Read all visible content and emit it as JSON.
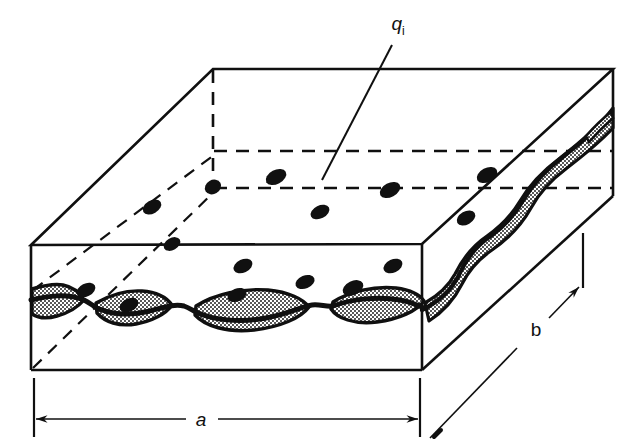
{
  "figure": {
    "kind": "technical-line-drawing",
    "background_color": "#ffffff",
    "line_color": "#101010",
    "particle_color": "#101010",
    "stipple_fill_color": "#101010",
    "stipple_background_color": "#ffffff"
  },
  "labels": {
    "particle": {
      "symbol": "q",
      "subscript": "i",
      "full": "qi",
      "x": 398,
      "y": 30
    },
    "dimension_a": {
      "text": "a",
      "x": 201,
      "y": 419
    },
    "dimension_b": {
      "text": "b",
      "x": 536,
      "y": 329
    }
  },
  "geometry": {
    "front_top_left": [
      31,
      245
    ],
    "front_top_right": [
      422,
      244
    ],
    "front_bottom_left": [
      31,
      370
    ],
    "front_bottom_right": [
      422,
      370
    ],
    "back_top_left": [
      213,
      69
    ],
    "back_top_right": [
      613,
      69
    ],
    "right_far_top": [
      613,
      69
    ],
    "right_far_bottom": [
      613,
      196
    ],
    "hidden_corner": [
      213,
      196
    ]
  },
  "particles": [
    {
      "cx": 276,
      "cy": 177,
      "rx": 11,
      "ry": 7,
      "rot": -28
    },
    {
      "cx": 390,
      "cy": 190,
      "rx": 11,
      "ry": 7,
      "rot": -28
    },
    {
      "cx": 320,
      "cy": 212,
      "rx": 10,
      "ry": 6.5,
      "rot": -26
    },
    {
      "cx": 466,
      "cy": 218,
      "rx": 10,
      "ry": 6.5,
      "rot": -30
    },
    {
      "cx": 487,
      "cy": 175,
      "rx": 11,
      "ry": 7,
      "rot": -28
    },
    {
      "cx": 213,
      "cy": 187,
      "rx": 8,
      "ry": 7,
      "rot": -30
    },
    {
      "cx": 152,
      "cy": 207,
      "rx": 10,
      "ry": 6.5,
      "rot": -30
    },
    {
      "cx": 172,
      "cy": 244,
      "rx": 9,
      "ry": 6,
      "rot": -30
    },
    {
      "cx": 243,
      "cy": 266,
      "rx": 10,
      "ry": 6.5,
      "rot": -25
    },
    {
      "cx": 305,
      "cy": 282,
      "rx": 10,
      "ry": 6.5,
      "rot": -22
    },
    {
      "cx": 393,
      "cy": 266,
      "rx": 10,
      "ry": 6.5,
      "rot": -25
    },
    {
      "cx": 86,
      "cy": 290,
      "rx": 10,
      "ry": 6.5,
      "rot": -27
    },
    {
      "cx": 129,
      "cy": 305,
      "rx": 10,
      "ry": 6.5,
      "rot": -27
    },
    {
      "cx": 237,
      "cy": 295,
      "rx": 10,
      "ry": 6.5,
      "rot": -22
    },
    {
      "cx": 353,
      "cy": 288,
      "rx": 11,
      "ry": 7,
      "rot": -26
    }
  ],
  "leader_line": {
    "from": [
      392,
      45
    ],
    "to": [
      322,
      180
    ]
  },
  "dimension_lines": {
    "a": {
      "y": 419,
      "x_start": 34,
      "x_end": 420,
      "extension_top_y": 378,
      "arrow": "both"
    },
    "b": {
      "from": [
        432,
        437
      ],
      "to": [
        570,
        250
      ],
      "extension_x": 583,
      "arrow": "end"
    }
  },
  "wave_front": {
    "description": "horizontal wavy stippled seam across front face",
    "blob_count": 4
  },
  "wave_right": {
    "description": "diagonal wavy stippled seam across right face",
    "blob_count": 3
  }
}
